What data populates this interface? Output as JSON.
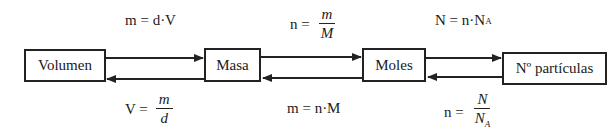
{
  "diagram": {
    "nodes": [
      {
        "id": "volumen",
        "label": "Volumen"
      },
      {
        "id": "masa",
        "label": "Masa"
      },
      {
        "id": "moles",
        "label": "Moles"
      },
      {
        "id": "particulas",
        "label": "Nº partículas"
      }
    ],
    "edges": [
      {
        "from": "volumen",
        "to": "masa",
        "formula": "m = d·V"
      },
      {
        "from": "masa",
        "to": "volumen",
        "formula": "V = m/d"
      },
      {
        "from": "masa",
        "to": "moles",
        "formula": "n = m/M"
      },
      {
        "from": "moles",
        "to": "masa",
        "formula": "m = n·M"
      },
      {
        "from": "moles",
        "to": "particulas",
        "formula": "N = n·N_A"
      },
      {
        "from": "particulas",
        "to": "moles",
        "formula": "n = N/N_A"
      }
    ]
  },
  "formulas": {
    "m_dV": {
      "lhs": "m = d·V"
    },
    "V_md": {
      "lhs": "V =",
      "num": "m",
      "den": "d"
    },
    "n_mM": {
      "lhs": "n =",
      "num": "m",
      "den": "M"
    },
    "m_nM": {
      "lhs": "m = n·M"
    },
    "N_nNA": {
      "lhs": "N = n·N",
      "sub": "A"
    },
    "n_NNA": {
      "lhs": "n =",
      "num": "N",
      "den": "N",
      "den_sub": "A"
    }
  }
}
